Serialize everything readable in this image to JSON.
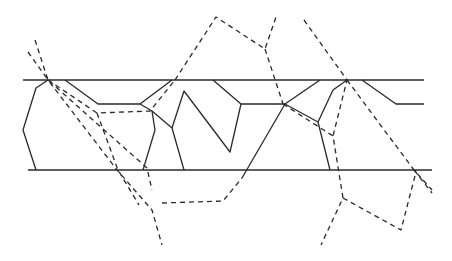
{
  "diagram": {
    "type": "line-drawing",
    "colors": {
      "background": "#ffffff",
      "stroke": "#2a2a2a"
    },
    "boundaries": [
      {
        "name": "top-boundary",
        "points": [
          [
            23,
            80
          ],
          [
            424,
            80
          ]
        ]
      },
      {
        "name": "bottom-boundary",
        "points": [
          [
            28,
            170
          ],
          [
            432,
            170
          ]
        ]
      }
    ],
    "solid_paths": [
      {
        "name": "left-cell",
        "points": [
          [
            48,
            80
          ],
          [
            36,
            88
          ],
          [
            23,
            130
          ],
          [
            36,
            170
          ]
        ]
      },
      {
        "name": "cell-2-top",
        "points": [
          [
            65,
            80
          ],
          [
            98,
            104
          ],
          [
            140,
            104
          ],
          [
            172,
            80
          ]
        ]
      },
      {
        "name": "cell-2-right",
        "points": [
          [
            140,
            104
          ],
          [
            152,
            111
          ],
          [
            155,
            130
          ],
          [
            143,
            170
          ]
        ]
      },
      {
        "name": "cell-3-left",
        "points": [
          [
            152,
            111
          ],
          [
            172,
            128
          ],
          [
            184,
            170
          ]
        ]
      },
      {
        "name": "zigzag",
        "points": [
          [
            172,
            128
          ],
          [
            184,
            91
          ],
          [
            230,
            152
          ],
          [
            241,
            104
          ]
        ]
      },
      {
        "name": "cell-4-top",
        "points": [
          [
            213,
            80
          ],
          [
            241,
            104
          ],
          [
            285,
            104
          ]
        ]
      },
      {
        "name": "cell-4-right",
        "points": [
          [
            285,
            104
          ],
          [
            320,
            80
          ]
        ]
      },
      {
        "name": "cell-5-left",
        "points": [
          [
            285,
            104
          ],
          [
            318,
            122
          ],
          [
            330,
            170
          ]
        ]
      },
      {
        "name": "cell-5-right",
        "points": [
          [
            318,
            122
          ],
          [
            333,
            90
          ],
          [
            347,
            80
          ]
        ]
      },
      {
        "name": "right-cell",
        "points": [
          [
            362,
            80
          ],
          [
            396,
            104
          ],
          [
            424,
            104
          ]
        ]
      },
      {
        "name": "bold-diagonal",
        "points": [
          [
            285,
            104
          ],
          [
            242,
            178
          ]
        ]
      }
    ],
    "dashed_paths": [
      {
        "name": "dash-left-a",
        "points": [
          [
            35,
            40
          ],
          [
            48,
            80
          ],
          [
            117,
            170
          ],
          [
            152,
            210
          ],
          [
            162,
            245
          ]
        ]
      },
      {
        "name": "dash-left-b",
        "points": [
          [
            28,
            52
          ],
          [
            48,
            80
          ],
          [
            147,
            168
          ],
          [
            152,
            190
          ]
        ]
      },
      {
        "name": "dash-left-c",
        "points": [
          [
            48,
            80
          ],
          [
            97,
            113
          ],
          [
            150,
            111
          ],
          [
            175,
            80
          ]
        ]
      },
      {
        "name": "dash-upper-a",
        "points": [
          [
            97,
            113
          ],
          [
            118,
            170
          ],
          [
            139,
            205
          ]
        ]
      },
      {
        "name": "dash-center-loop",
        "points": [
          [
            175,
            80
          ],
          [
            216,
            17
          ],
          [
            265,
            49
          ],
          [
            276,
            17
          ]
        ]
      },
      {
        "name": "dash-center-down",
        "points": [
          [
            265,
            49
          ],
          [
            283,
            104
          ]
        ]
      },
      {
        "name": "dash-center-lower",
        "points": [
          [
            162,
            203
          ],
          [
            223,
            201
          ],
          [
            242,
            178
          ]
        ]
      },
      {
        "name": "dash-mid-right",
        "points": [
          [
            283,
            104
          ],
          [
            333,
            136
          ],
          [
            343,
            198
          ],
          [
            321,
            245
          ]
        ]
      },
      {
        "name": "dash-right-upper",
        "points": [
          [
            304,
            20
          ],
          [
            347,
            80
          ],
          [
            333,
            136
          ]
        ]
      },
      {
        "name": "dash-right-lower",
        "points": [
          [
            347,
            80
          ],
          [
            414,
            170
          ],
          [
            432,
            190
          ]
        ]
      },
      {
        "name": "dash-right-loop",
        "points": [
          [
            343,
            198
          ],
          [
            401,
            230
          ],
          [
            416,
            172
          ],
          [
            414,
            170
          ]
        ]
      },
      {
        "name": "dash-right-tail",
        "points": [
          [
            414,
            170
          ],
          [
            432,
            193
          ]
        ]
      }
    ]
  }
}
